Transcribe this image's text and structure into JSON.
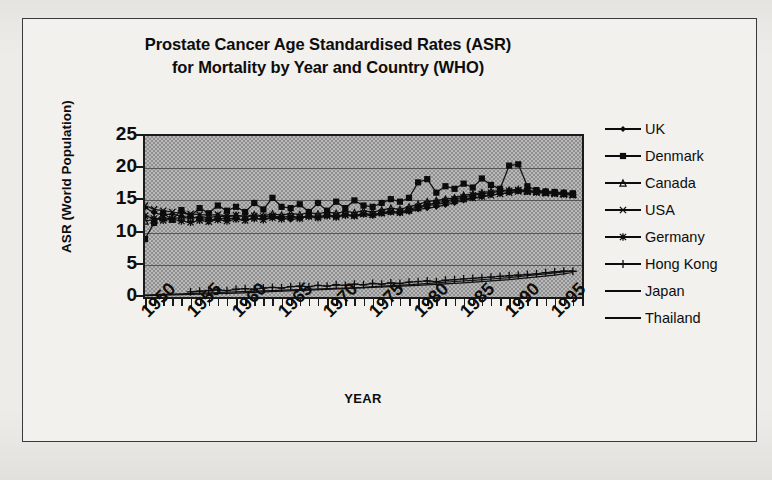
{
  "chart_data": {
    "type": "line",
    "title": "Prostate Cancer Age Standardised Rates (ASR) for Mortality by Year and Country (WHO)",
    "title_lines": [
      "Prostate Cancer Age Standardised Rates (ASR)",
      "for Mortality by Year and Country (WHO)"
    ],
    "xlabel": "YEAR",
    "ylabel": "ASR (World Population)",
    "ylim": [
      0,
      25
    ],
    "xlim": [
      1950,
      1998
    ],
    "yticks": [
      25,
      20,
      15,
      10,
      5,
      0
    ],
    "xticks": [
      1950,
      1955,
      1960,
      1965,
      1970,
      1975,
      1980,
      1985,
      1990,
      1995
    ],
    "xtick_step_minor": 1,
    "grid": "horizontal",
    "legend_position": "right",
    "plot_background": "#b9b9b9",
    "series": [
      {
        "name": "UK",
        "marker": "diamond",
        "color": "#101010",
        "x": [
          1950,
          1951,
          1952,
          1953,
          1954,
          1955,
          1956,
          1957,
          1958,
          1959,
          1960,
          1961,
          1962,
          1963,
          1964,
          1965,
          1966,
          1967,
          1968,
          1969,
          1970,
          1971,
          1972,
          1973,
          1974,
          1975,
          1976,
          1977,
          1978,
          1979,
          1980,
          1981,
          1982,
          1983,
          1984,
          1985,
          1986,
          1987,
          1988,
          1989,
          1990,
          1991,
          1992,
          1993,
          1994,
          1995,
          1996,
          1997
        ],
        "values": [
          13.9,
          13.1,
          12.7,
          12.9,
          12.5,
          12.4,
          12.2,
          12.0,
          12.1,
          12.3,
          12.1,
          12.0,
          12.2,
          12.1,
          12.4,
          12.3,
          12.0,
          12.2,
          12.5,
          12.3,
          12.6,
          12.4,
          12.7,
          12.5,
          12.8,
          12.6,
          12.9,
          13.1,
          13.0,
          13.2,
          13.6,
          13.8,
          14.0,
          14.3,
          14.6,
          15.0,
          15.3,
          15.5,
          15.8,
          16.0,
          16.2,
          16.4,
          16.5,
          16.4,
          16.3,
          16.2,
          16.1,
          16.0
        ]
      },
      {
        "name": "Denmark",
        "marker": "square",
        "color": "#101010",
        "x": [
          1950,
          1951,
          1952,
          1953,
          1954,
          1955,
          1956,
          1957,
          1958,
          1959,
          1960,
          1961,
          1962,
          1963,
          1964,
          1965,
          1966,
          1967,
          1968,
          1969,
          1970,
          1971,
          1972,
          1973,
          1974,
          1975,
          1976,
          1977,
          1978,
          1979,
          1980,
          1981,
          1982,
          1983,
          1984,
          1985,
          1986,
          1987,
          1988,
          1989,
          1990,
          1991,
          1992,
          1993,
          1994,
          1995,
          1996,
          1997
        ],
        "values": [
          9.0,
          11.5,
          13.0,
          12.0,
          13.5,
          12.6,
          13.8,
          13.0,
          14.2,
          13.4,
          14.0,
          13.2,
          14.6,
          13.6,
          15.4,
          14.0,
          13.8,
          14.4,
          13.2,
          14.6,
          13.4,
          14.8,
          13.8,
          15.0,
          14.2,
          14.0,
          14.6,
          15.2,
          14.8,
          15.4,
          17.8,
          18.3,
          16.2,
          17.2,
          16.8,
          17.6,
          17.0,
          18.4,
          17.4,
          16.8,
          20.4,
          20.6,
          17.2,
          16.6,
          16.4,
          16.3,
          16.2,
          16.1
        ]
      },
      {
        "name": "Canada",
        "marker": "triangle",
        "color": "#101010",
        "x": [
          1950,
          1951,
          1952,
          1953,
          1954,
          1955,
          1956,
          1957,
          1958,
          1959,
          1960,
          1961,
          1962,
          1963,
          1964,
          1965,
          1966,
          1967,
          1968,
          1969,
          1970,
          1971,
          1972,
          1973,
          1974,
          1975,
          1976,
          1977,
          1978,
          1979,
          1980,
          1981,
          1982,
          1983,
          1984,
          1985,
          1986,
          1987,
          1988,
          1989,
          1990,
          1991,
          1992,
          1993,
          1994,
          1995,
          1996,
          1997
        ],
        "values": [
          11.8,
          12.0,
          12.3,
          12.1,
          12.4,
          12.2,
          12.5,
          12.3,
          12.6,
          12.4,
          12.7,
          12.5,
          12.8,
          12.6,
          12.9,
          12.7,
          13.0,
          12.8,
          13.1,
          12.9,
          13.2,
          13.0,
          13.3,
          13.1,
          13.4,
          13.2,
          13.5,
          13.8,
          13.6,
          14.0,
          14.4,
          14.8,
          15.0,
          15.2,
          15.4,
          15.8,
          16.0,
          16.2,
          16.4,
          16.5,
          16.6,
          16.7,
          16.5,
          16.4,
          16.3,
          16.2,
          16.1,
          16.0
        ]
      },
      {
        "name": "USA",
        "marker": "x",
        "color": "#101010",
        "x": [
          1950,
          1951,
          1952,
          1953,
          1954,
          1955,
          1956,
          1957,
          1958,
          1959,
          1960,
          1961,
          1962,
          1963,
          1964,
          1965,
          1966,
          1967,
          1968,
          1969,
          1970,
          1971,
          1972,
          1973,
          1974,
          1975,
          1976,
          1977,
          1978,
          1979,
          1980,
          1981,
          1982,
          1983,
          1984,
          1985,
          1986,
          1987,
          1988,
          1989,
          1990,
          1991,
          1992,
          1993,
          1994,
          1995,
          1996,
          1997
        ],
        "values": [
          14.2,
          13.6,
          13.4,
          13.2,
          13.0,
          12.9,
          12.8,
          12.7,
          12.8,
          12.6,
          12.7,
          12.5,
          12.6,
          12.5,
          12.6,
          12.4,
          12.5,
          12.4,
          12.6,
          12.5,
          12.7,
          12.6,
          12.8,
          12.7,
          12.9,
          12.8,
          13.0,
          13.2,
          13.1,
          13.4,
          13.8,
          14.2,
          14.4,
          14.6,
          14.9,
          15.2,
          15.4,
          15.6,
          15.8,
          16.0,
          16.2,
          16.4,
          16.3,
          16.2,
          16.1,
          16.0,
          15.9,
          15.8
        ]
      },
      {
        "name": "Germany",
        "marker": "asterisk",
        "color": "#101010",
        "x": [
          1950,
          1951,
          1952,
          1953,
          1954,
          1955,
          1956,
          1957,
          1958,
          1959,
          1960,
          1961,
          1962,
          1963,
          1964,
          1965,
          1966,
          1967,
          1968,
          1969,
          1970,
          1971,
          1972,
          1973,
          1974,
          1975,
          1976,
          1977,
          1978,
          1979,
          1980,
          1981,
          1982,
          1983,
          1984,
          1985,
          1986,
          1987,
          1988,
          1989,
          1990,
          1991,
          1992,
          1993,
          1994,
          1995,
          1996,
          1997
        ],
        "values": [
          12.6,
          12.2,
          11.9,
          12.1,
          11.8,
          11.6,
          11.9,
          11.7,
          12.0,
          11.8,
          12.1,
          11.9,
          12.2,
          12.0,
          12.3,
          12.1,
          12.4,
          12.2,
          12.5,
          12.3,
          12.6,
          12.4,
          12.7,
          12.6,
          12.9,
          12.8,
          13.1,
          13.3,
          13.2,
          13.6,
          14.0,
          14.4,
          14.6,
          14.9,
          15.2,
          15.5,
          15.8,
          16.0,
          16.2,
          16.4,
          16.5,
          16.6,
          16.4,
          16.3,
          16.2,
          16.1,
          16.0,
          15.9
        ]
      },
      {
        "name": "Hong Kong",
        "marker": "plus",
        "color": "#101010",
        "x": [
          1955,
          1956,
          1957,
          1958,
          1959,
          1960,
          1961,
          1962,
          1963,
          1964,
          1965,
          1966,
          1967,
          1968,
          1969,
          1970,
          1971,
          1972,
          1973,
          1974,
          1975,
          1976,
          1977,
          1978,
          1979,
          1980,
          1981,
          1982,
          1983,
          1984,
          1985,
          1986,
          1987,
          1988,
          1989,
          1990,
          1991,
          1992,
          1993,
          1994,
          1995,
          1996,
          1997
        ],
        "values": [
          0.8,
          0.9,
          1.0,
          1.1,
          1.0,
          1.2,
          1.3,
          1.2,
          1.4,
          1.5,
          1.4,
          1.6,
          1.7,
          1.6,
          1.8,
          1.7,
          1.9,
          1.8,
          2.0,
          1.9,
          2.1,
          2.0,
          2.2,
          2.1,
          2.3,
          2.4,
          2.5,
          2.4,
          2.6,
          2.7,
          2.8,
          2.9,
          3.0,
          3.1,
          3.2,
          3.3,
          3.4,
          3.5,
          3.6,
          3.8,
          3.9,
          4.0,
          4.0
        ]
      },
      {
        "name": "Japan",
        "marker": "none",
        "color": "#101010",
        "x": [
          1950,
          1952,
          1954,
          1956,
          1958,
          1960,
          1962,
          1964,
          1966,
          1968,
          1970,
          1972,
          1974,
          1976,
          1978,
          1980,
          1982,
          1984,
          1986,
          1988,
          1990,
          1992,
          1994,
          1996,
          1997
        ],
        "values": [
          0.3,
          0.4,
          0.5,
          0.6,
          0.7,
          0.8,
          0.9,
          1.0,
          1.1,
          1.2,
          1.3,
          1.4,
          1.5,
          1.7,
          1.8,
          2.0,
          2.2,
          2.4,
          2.6,
          2.8,
          3.0,
          3.3,
          3.6,
          3.9,
          4.0
        ]
      },
      {
        "name": "Thailand",
        "marker": "none",
        "color": "#101010",
        "x": [
          1950,
          1955,
          1960,
          1965,
          1970,
          1975,
          1980,
          1985,
          1990,
          1995,
          1997
        ],
        "values": [
          0.2,
          0.4,
          0.6,
          0.9,
          1.2,
          1.5,
          1.8,
          2.2,
          2.7,
          3.4,
          3.8
        ]
      }
    ]
  },
  "legend": {
    "items": [
      {
        "label": "UK",
        "marker": "diamond"
      },
      {
        "label": "Denmark",
        "marker": "square"
      },
      {
        "label": "Canada",
        "marker": "triangle"
      },
      {
        "label": "USA",
        "marker": "x"
      },
      {
        "label": "Germany",
        "marker": "asterisk"
      },
      {
        "label": "Hong Kong",
        "marker": "plus"
      },
      {
        "label": "Japan",
        "marker": "none"
      },
      {
        "label": "Thailand",
        "marker": "none"
      }
    ]
  }
}
